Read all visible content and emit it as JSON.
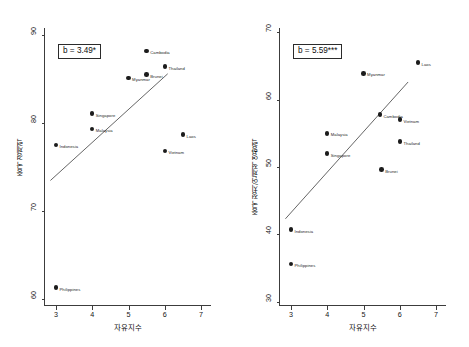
{
  "figure": {
    "background": "#ffffff",
    "point_color": "#1c1c1c",
    "line_color": "#3c3c3c",
    "axis_color": "#3c3c3c"
  },
  "chart_data": [
    {
      "type": "scatter",
      "panel": "left",
      "title": "",
      "xlabel": "자유지수",
      "ylabel": "중국 경제력",
      "xlim": [
        2.7,
        7.3
      ],
      "ylim": [
        59.2,
        90.8
      ],
      "xticks": [
        3,
        4,
        5,
        6,
        7
      ],
      "yticks": [
        60,
        70,
        80,
        90
      ],
      "grid": false,
      "annotation": "b = 3.49*",
      "fit_line": {
        "x1": 2.85,
        "y1": 73.4,
        "x2": 6.1,
        "y2": 85.6
      },
      "points": [
        {
          "label": "Cambodia",
          "x": 5.5,
          "y": 88.2,
          "label_side": "right"
        },
        {
          "label": "Thailand",
          "x": 6.0,
          "y": 86.4,
          "label_side": "right"
        },
        {
          "label": "Brunei",
          "x": 5.5,
          "y": 85.5,
          "label_side": "right"
        },
        {
          "label": "Myanmar",
          "x": 5.0,
          "y": 85.1,
          "label_side": "right"
        },
        {
          "label": "Singapore",
          "x": 4.0,
          "y": 81.1,
          "label_side": "right"
        },
        {
          "label": "Malaysia",
          "x": 4.0,
          "y": 79.3,
          "label_side": "right"
        },
        {
          "label": "Laos",
          "x": 6.5,
          "y": 78.7,
          "label_side": "right"
        },
        {
          "label": "Indonesia",
          "x": 3.0,
          "y": 77.5,
          "label_side": "right"
        },
        {
          "label": "Vietnam",
          "x": 6.0,
          "y": 76.8,
          "label_side": "right"
        },
        {
          "label": "Philippines",
          "x": 3.0,
          "y": 61.3,
          "label_side": "right"
        }
      ]
    },
    {
      "type": "scatter",
      "panel": "right",
      "title": "",
      "xlabel": "자유지수",
      "ylabel": "중국 정치/언제적 영향력",
      "xlim": [
        2.7,
        7.3
      ],
      "ylim": [
        29.4,
        70.6
      ],
      "xticks": [
        3,
        4,
        5,
        6,
        7
      ],
      "yticks": [
        30,
        40,
        50,
        60,
        70
      ],
      "grid": false,
      "annotation": "b = 5.59***",
      "fit_line": {
        "x1": 2.85,
        "y1": 42.2,
        "x2": 6.25,
        "y2": 62.6
      },
      "points": [
        {
          "label": "Laos",
          "x": 6.5,
          "y": 65.5,
          "label_side": "right"
        },
        {
          "label": "Myanmar",
          "x": 5.0,
          "y": 63.9,
          "label_side": "right"
        },
        {
          "label": "Cambodia",
          "x": 5.45,
          "y": 57.8,
          "label_side": "right"
        },
        {
          "label": "Vietnam",
          "x": 6.0,
          "y": 57.0,
          "label_side": "right"
        },
        {
          "label": "Malaysia",
          "x": 4.0,
          "y": 55.0,
          "label_side": "right"
        },
        {
          "label": "Thailand",
          "x": 6.0,
          "y": 53.8,
          "label_side": "right"
        },
        {
          "label": "Singapore",
          "x": 4.0,
          "y": 52.0,
          "label_side": "right"
        },
        {
          "label": "Brunei",
          "x": 5.5,
          "y": 49.6,
          "label_side": "right"
        },
        {
          "label": "Indonesia",
          "x": 3.0,
          "y": 40.7,
          "label_side": "right"
        },
        {
          "label": "Philippines",
          "x": 3.0,
          "y": 35.6,
          "label_side": "right"
        }
      ]
    }
  ]
}
